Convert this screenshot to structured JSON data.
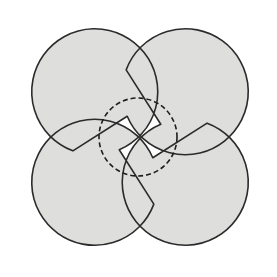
{
  "figure": {
    "name": "quatrefoil-with-inscribed-dashed-circle",
    "background_color": "#ffffff",
    "width": 277,
    "height": 277,
    "labels": [],
    "annotations": [],
    "shapes": {
      "quatrefoil": {
        "name": "four-petal-flower",
        "fill_color": "#dededd",
        "stroke_color": "#2b2b2b",
        "stroke_width": 1.6,
        "stroke_style": "solid",
        "center_x": 140,
        "center_y": 137,
        "petal_count": 4,
        "petal_radius": 63,
        "petal_center_offset": 64,
        "cusp_radius": 62,
        "bounds": {
          "left": 13,
          "top": 13,
          "right": 267,
          "bottom": 262
        },
        "path": "M 140 73.5 C 140 2 268 2 268 73.5 C 268 145 215 137 203.5 137 C 215 137 268 129 268 200.5 C 268 272 140 272 140 200.5 C 140 272 12 272 12 200.5 C 12 129 65 137 76.5 137 C 65 137 12 145 12 73.5 C 12 2 140 2 140 73.5 Z"
      },
      "inscribed_circle": {
        "name": "dashed-inscribed-circle",
        "fill_color": "none",
        "stroke_color": "#1f1f1f",
        "stroke_width": 1.6,
        "stroke_style": "dashed",
        "dash_pattern": "5 3",
        "center_x": 138,
        "center_y": 137,
        "radius": 39
      }
    }
  }
}
